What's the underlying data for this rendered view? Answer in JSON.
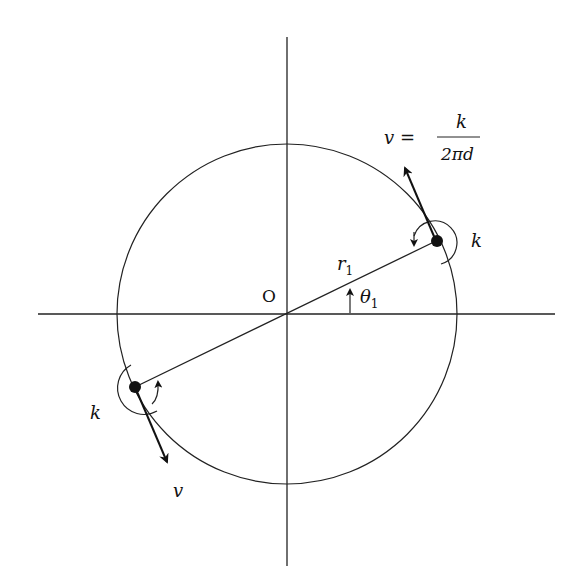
{
  "diagram": {
    "origin_label": "O",
    "radius_label": "r",
    "radius_subscript": "1",
    "angle_label": "θ",
    "angle_subscript": "1",
    "vortex_strength_label_right": "k",
    "vortex_strength_label_left": "k",
    "velocity_label_left": "v",
    "velocity_eq_lhs": "v =",
    "velocity_eq_numerator": "k",
    "velocity_eq_denominator": "2πd",
    "colors": {
      "stroke": "#222222",
      "background": "#ffffff"
    }
  }
}
